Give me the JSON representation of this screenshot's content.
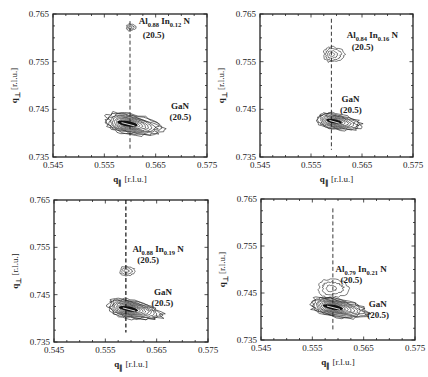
{
  "chart_data": [
    {
      "type": "heatmap",
      "subtype": "contour",
      "panel": "top-left",
      "frame": {
        "x0": 53,
        "y0": 14,
        "x1": 207,
        "y1": 157
      },
      "xlabel": "q∥ [r.l.u.]",
      "ylabel": "q⊥ [r.l.u.]",
      "xlim": [
        0.545,
        0.575
      ],
      "ylim": [
        0.735,
        0.765
      ],
      "xticks": [
        "0.545",
        "0.555",
        "0.565",
        "0.575"
      ],
      "yticks": [
        "0.765",
        "0.755",
        "0.745",
        "0.735"
      ],
      "grid": false,
      "dashed_line_x": 0.56,
      "dashed_line_y_range": [
        0.7365,
        0.7635
      ],
      "peaks": [
        {
          "name": "GaN",
          "label": "GaN",
          "order": "(20.5)",
          "q_par": 0.5595,
          "q_perp": 0.742,
          "rx": 0.0058,
          "ry": 0.0022,
          "tilt": 10,
          "levels": 12
        },
        {
          "name": "AlInN",
          "label_main": "Al",
          "sub1": "0.88",
          "mid": " In",
          "sub2": "0.12",
          "tail": " N",
          "order": "(20.5)",
          "q_par": 0.56,
          "q_perp": 0.7622,
          "rx": 0.0009,
          "ry": 0.0007,
          "tilt": 0,
          "levels": 3
        }
      ],
      "annotations": [
        {
          "text": "Al0.88 In0.12 N",
          "q_par": 0.5617,
          "q_perp": 0.763
        },
        {
          "text": "(20.5)",
          "q_par": 0.5625,
          "q_perp": 0.76
        },
        {
          "text": "GaN",
          "q_par": 0.568,
          "q_perp": 0.745
        },
        {
          "text": "(20.5)",
          "q_par": 0.5677,
          "q_perp": 0.7427
        }
      ]
    },
    {
      "type": "heatmap",
      "subtype": "contour",
      "panel": "top-right",
      "frame": {
        "x0": 260,
        "y0": 14,
        "x1": 413,
        "y1": 157
      },
      "xlabel": "q∥ [r.l.u.]",
      "ylabel": "q⊥ [r.l.u.]",
      "xlim": [
        0.545,
        0.575
      ],
      "ylim": [
        0.735,
        0.765
      ],
      "xticks": [
        "0.545",
        "0.555",
        "0.565",
        "0.575"
      ],
      "yticks": [
        "0.765",
        "0.755",
        "0.745",
        "0.735"
      ],
      "grid": false,
      "dashed_line_x": 0.559,
      "dashed_line_y_range": [
        0.7365,
        0.764
      ],
      "peaks": [
        {
          "name": "GaN",
          "q_par": 0.5595,
          "q_perp": 0.7425,
          "rx": 0.0045,
          "ry": 0.0017,
          "tilt": 10,
          "levels": 10
        },
        {
          "name": "AlInN",
          "q_par": 0.559,
          "q_perp": 0.7565,
          "rx": 0.002,
          "ry": 0.0016,
          "tilt": 0,
          "levels": 4
        }
      ],
      "annotations": [
        {
          "text": "Al0.84 In0.16 N",
          "q_par": 0.562,
          "q_perp": 0.76
        },
        {
          "text": "(20.5)",
          "q_par": 0.563,
          "q_perp": 0.7575
        },
        {
          "text": "GaN",
          "q_par": 0.561,
          "q_perp": 0.7465
        },
        {
          "text": "(20.5)",
          "q_par": 0.5607,
          "q_perp": 0.7443
        }
      ]
    },
    {
      "type": "heatmap",
      "subtype": "contour",
      "panel": "bottom-left",
      "frame": {
        "x0": 54,
        "y0": 200,
        "x1": 208,
        "y1": 342
      },
      "xlabel": "q∥ [r.l.u.]",
      "ylabel": "q⊥ [r.l.u.]",
      "xlim": [
        0.545,
        0.575
      ],
      "ylim": [
        0.735,
        0.765
      ],
      "xticks": [
        "0.545",
        "0.555",
        "0.565",
        "0.575"
      ],
      "yticks": [
        "0.765",
        "0.755",
        "0.745",
        "0.735"
      ],
      "grid": false,
      "dashed_line_x": 0.559,
      "dashed_line_y_range": [
        0.737,
        0.765
      ],
      "peaks": [
        {
          "name": "GaN",
          "q_par": 0.5595,
          "q_perp": 0.742,
          "rx": 0.0055,
          "ry": 0.002,
          "tilt": 10,
          "levels": 12
        },
        {
          "name": "AlInN",
          "q_par": 0.559,
          "q_perp": 0.75,
          "rx": 0.0015,
          "ry": 0.001,
          "tilt": 0,
          "levels": 3
        }
      ],
      "annotations": [
        {
          "text": "Al0.88 In0.19 N",
          "q_par": 0.5603,
          "q_perp": 0.754
        },
        {
          "text": "(20.5)",
          "q_par": 0.5612,
          "q_perp": 0.7517
        },
        {
          "text": "GaN",
          "q_par": 0.5645,
          "q_perp": 0.745
        },
        {
          "text": "(20.5)",
          "q_par": 0.564,
          "q_perp": 0.7427
        }
      ]
    },
    {
      "type": "heatmap",
      "subtype": "contour",
      "panel": "bottom-right",
      "frame": {
        "x0": 261,
        "y0": 199,
        "x1": 415,
        "y1": 340
      },
      "xlabel": "q∥ [r.l.u.]",
      "ylabel": "q⊥ [r.l.u.]",
      "xlim": [
        0.545,
        0.575
      ],
      "ylim": [
        0.735,
        0.765
      ],
      "xticks": [
        "0.545",
        "0.555",
        "0.565",
        "0.575"
      ],
      "yticks": [
        "0.765",
        "0.755",
        "0.745",
        "0.735"
      ],
      "grid": false,
      "dashed_line_x": 0.559,
      "dashed_line_y_range": [
        0.737,
        0.763
      ],
      "peaks": [
        {
          "name": "GaN",
          "q_par": 0.559,
          "q_perp": 0.742,
          "rx": 0.0058,
          "ry": 0.002,
          "tilt": 10,
          "levels": 12
        },
        {
          "name": "AlInN",
          "q_par": 0.5585,
          "q_perp": 0.746,
          "rx": 0.003,
          "ry": 0.002,
          "tilt": 0,
          "levels": 3
        }
      ],
      "annotations": [
        {
          "text": "Al0.79 In0.21 N",
          "q_par": 0.5595,
          "q_perp": 0.7495
        },
        {
          "text": "(20.5)",
          "q_par": 0.5605,
          "q_perp": 0.7472
        },
        {
          "text": "GaN",
          "q_par": 0.566,
          "q_perp": 0.742
        },
        {
          "text": "(20.5)",
          "q_par": 0.5657,
          "q_perp": 0.7397
        }
      ]
    }
  ],
  "labels": {
    "xlabel_main": "q",
    "xlabel_sub": "∥",
    "xlabel_unit": " [r.l.u.]",
    "ylabel_main": "q",
    "ylabel_sub": "⊥",
    "ylabel_unit": " [r.l.u.]"
  },
  "panels": [
    {
      "alinn": {
        "a": "Al",
        "s1": "0.88",
        "b": " In",
        "s2": "0.12",
        "c": " N"
      },
      "order": "(20.5)",
      "gan": "GaN"
    },
    {
      "alinn": {
        "a": "Al",
        "s1": "0.84",
        "b": " In",
        "s2": "0.16",
        "c": " N"
      },
      "order": "(20.5)",
      "gan": "GaN"
    },
    {
      "alinn": {
        "a": "Al",
        "s1": "0.88",
        "b": " In",
        "s2": "0.19",
        "c": " N"
      },
      "order": "(20.5)",
      "gan": "GaN"
    },
    {
      "alinn": {
        "a": "Al",
        "s1": "0.79",
        "b": " In",
        "s2": "0.21",
        "c": " N"
      },
      "order": "(20.5)",
      "gan": "GaN"
    }
  ],
  "colors": {
    "ink": "#222222",
    "background": "#ffffff"
  }
}
